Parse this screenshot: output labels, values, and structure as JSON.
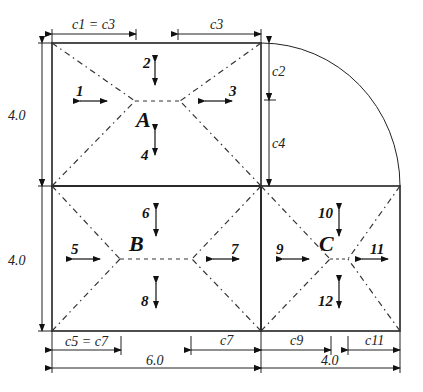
{
  "diagram": {
    "panels": [
      {
        "label": "A",
        "width": "6.0",
        "height": "4.0"
      },
      {
        "label": "B",
        "width": "6.0",
        "height": "4.0"
      },
      {
        "label": "C",
        "width": "4.0",
        "height": "4.0"
      }
    ],
    "dimensions": {
      "top_left": "c1 = c3",
      "top_right": "c3",
      "right_upper": "c2",
      "right_lower": "c4",
      "left_upper": "4.0",
      "left_lower": "4.0",
      "bottom_left_part": "c5 = c7",
      "bottom_mid_part": "c7",
      "bottom_c9": "c9",
      "bottom_c11": "c11",
      "bottom_total_left": "6.0",
      "bottom_total_right": "4.0"
    },
    "edge_numbers": [
      "1",
      "2",
      "3",
      "4",
      "5",
      "6",
      "7",
      "8",
      "9",
      "10",
      "11",
      "12"
    ]
  }
}
